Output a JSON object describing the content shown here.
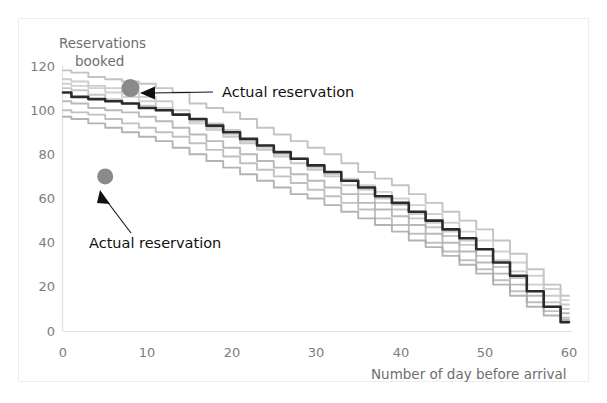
{
  "chart_data": {
    "type": "line",
    "title": "",
    "xlabel": "Number of day before arrival",
    "ylabel": "Reservations booked",
    "ylabel_line1": "Reservations",
    "ylabel_line2": "booked",
    "xlim": [
      0,
      60
    ],
    "ylim": [
      0,
      120
    ],
    "xticks": [
      0,
      10,
      20,
      30,
      40,
      50,
      60
    ],
    "yticks": [
      0,
      20,
      40,
      60,
      80,
      100,
      120
    ],
    "grid": false,
    "legend_position": "none",
    "x": [
      0,
      2,
      4,
      6,
      8,
      10,
      12,
      14,
      16,
      18,
      20,
      22,
      24,
      26,
      28,
      30,
      32,
      34,
      36,
      38,
      40,
      42,
      44,
      46,
      48,
      50,
      52,
      54,
      56,
      58,
      60
    ],
    "series": [
      {
        "name": "Historical booking curve 1",
        "color": "#b9b9b9",
        "emphasis": "light",
        "values": [
          118,
          117,
          115,
          114,
          113,
          112,
          110,
          108,
          103,
          101,
          99,
          96,
          92,
          89,
          86,
          83,
          80,
          76,
          72,
          69,
          66,
          62,
          58,
          54,
          50,
          46,
          41,
          35,
          28,
          21,
          16
        ]
      },
      {
        "name": "Historical booking curve 2",
        "color": "#c4c4c4",
        "emphasis": "light",
        "values": [
          114,
          113,
          111,
          110,
          108,
          106,
          104,
          100,
          96,
          94,
          91,
          87,
          84,
          81,
          78,
          74,
          71,
          68,
          64,
          60,
          57,
          53,
          49,
          45,
          41,
          37,
          32,
          27,
          21,
          16,
          12
        ]
      },
      {
        "name": "Historical booking curve 3",
        "color": "#bdbdbd",
        "emphasis": "light",
        "values": [
          110,
          109,
          107,
          105,
          103,
          102,
          100,
          98,
          95,
          92,
          88,
          85,
          82,
          79,
          76,
          73,
          70,
          66,
          62,
          58,
          55,
          51,
          47,
          43,
          39,
          34,
          29,
          24,
          18,
          13,
          10
        ]
      },
      {
        "name": "Historical booking curve 4",
        "color": "#adadad",
        "emphasis": "light",
        "values": [
          104,
          103,
          101,
          100,
          99,
          97,
          95,
          92,
          89,
          86,
          83,
          80,
          77,
          74,
          71,
          68,
          65,
          62,
          58,
          55,
          52,
          48,
          44,
          40,
          36,
          31,
          26,
          21,
          16,
          11,
          8
        ]
      },
      {
        "name": "Historical booking curve 5",
        "color": "#b5b5b5",
        "emphasis": "light",
        "values": [
          100,
          99,
          98,
          96,
          94,
          92,
          90,
          88,
          85,
          82,
          79,
          76,
          73,
          70,
          67,
          64,
          61,
          58,
          55,
          51,
          48,
          44,
          40,
          36,
          32,
          28,
          23,
          18,
          13,
          9,
          6
        ]
      },
      {
        "name": "Historical booking curve 6",
        "color": "#a6a6a6",
        "emphasis": "light",
        "values": [
          97,
          96,
          94,
          92,
          90,
          88,
          86,
          83,
          80,
          77,
          74,
          71,
          68,
          65,
          62,
          60,
          57,
          54,
          51,
          48,
          45,
          41,
          38,
          34,
          30,
          26,
          21,
          16,
          11,
          7,
          5
        ]
      },
      {
        "name": "Historical booking curve 7",
        "color": "#c9c9c9",
        "emphasis": "light",
        "values": [
          112,
          111,
          110,
          108,
          106,
          104,
          101,
          98,
          94,
          91,
          89,
          86,
          83,
          80,
          78,
          75,
          72,
          69,
          66,
          63,
          60,
          57,
          53,
          49,
          45,
          41,
          36,
          31,
          25,
          19,
          14
        ]
      },
      {
        "name": "Average / forecast booking curve",
        "color": "#2b2b2b",
        "emphasis": "dark",
        "values": [
          108,
          106,
          105,
          104,
          103,
          101,
          100,
          98,
          96,
          93,
          90,
          87,
          84,
          81,
          78,
          75,
          72,
          68,
          65,
          61,
          58,
          54,
          50,
          46,
          42,
          37,
          31,
          25,
          18,
          11,
          4
        ]
      }
    ],
    "points": [
      {
        "name": "Actual reservation upper",
        "x": 8,
        "y": 110,
        "color": "#8a8a8a",
        "radius_px": 9,
        "label": "Actual reservation"
      },
      {
        "name": "Actual reservation lower",
        "x": 5,
        "y": 70,
        "color": "#8a8a8a",
        "radius_px": 8,
        "label": "Actual reservation"
      }
    ],
    "annotations": [
      {
        "name": "annotation-upper",
        "text": "Actual reservation",
        "text_x_px": 222,
        "text_y_px": 97,
        "arrow_tail_x_px": 213,
        "arrow_tail_y_px": 92,
        "arrow_head_x_px": 147,
        "arrow_head_y_px": 93
      },
      {
        "name": "annotation-lower",
        "text": "Actual reservation",
        "text_x_px": 89,
        "text_y_px": 248,
        "arrow_tail_x_px": 131,
        "arrow_tail_y_px": 231,
        "arrow_head_x_px": 102,
        "arrow_head_y_px": 196
      }
    ]
  },
  "axes": {
    "x_tick_labels": [
      "0",
      "10",
      "20",
      "30",
      "40",
      "50",
      "60"
    ],
    "y_tick_labels": [
      "0",
      "20",
      "40",
      "60",
      "80",
      "100",
      "120"
    ],
    "x_axis_title": "Number of day before arrival",
    "y_axis_title_line1": "Reservations",
    "y_axis_title_line2": "booked"
  },
  "colors": {
    "axis": "#e2e2e2",
    "frame": "#ededed",
    "tick_text": "#7d7d7d",
    "annotation_text": "#111111",
    "marker": "#8a8a8a",
    "highlight_series": "#2b2b2b",
    "background": "#ffffff"
  }
}
